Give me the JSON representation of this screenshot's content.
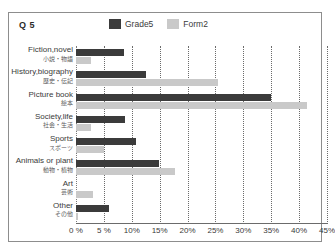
{
  "figure": {
    "question_label": "Q 5",
    "border_color": "#8d8d8d",
    "background": "#ffffff"
  },
  "legend": {
    "position": "top-center",
    "entries": [
      {
        "label": "Grade5",
        "color": "#3b3b3b",
        "icon": "legend-swatch-icon"
      },
      {
        "label": "Form2",
        "color": "#c9c9c9",
        "icon": "legend-swatch-icon"
      }
    ]
  },
  "chart_data": {
    "type": "bar",
    "orientation": "horizontal",
    "title": "Q 5",
    "xlabel": "",
    "ylabel": "",
    "xlim": [
      0,
      45
    ],
    "xunit": "%",
    "grid": true,
    "legend_position": "top-center",
    "xticks": [
      0,
      5,
      10,
      15,
      20,
      25,
      30,
      35,
      40,
      45
    ],
    "xticklabels": [
      "0 %",
      "5 %",
      "10%",
      "15%",
      "20%",
      "25%",
      "30%",
      "35%",
      "40%",
      "45%"
    ],
    "categories": [
      "Fiction,novel",
      "History,biography",
      "Picture book",
      "Society,life",
      "Sports",
      "Animals or plant",
      "Art",
      "Other"
    ],
    "categories_jp": [
      "小説・物語",
      "歴史・伝記",
      "絵本",
      "社会・生活",
      "スポーツ",
      "動物・植物",
      "芸術",
      "その他"
    ],
    "series": [
      {
        "name": "Grade5",
        "color": "#3b3b3b",
        "values": [
          8.6,
          12.5,
          35.0,
          8.7,
          10.8,
          14.8,
          0.0,
          6.0
        ]
      },
      {
        "name": "Form2",
        "color": "#c9c9c9",
        "values": [
          2.7,
          25.5,
          41.5,
          2.7,
          5.0,
          17.8,
          3.0,
          0.4
        ]
      }
    ]
  }
}
